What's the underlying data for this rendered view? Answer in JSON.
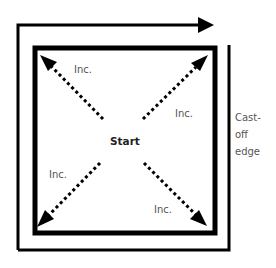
{
  "diagram": {
    "center_label": "Start",
    "increase_labels": [
      "Inc.",
      "Inc.",
      "Inc.",
      "Inc."
    ],
    "edge_label": [
      "Cast-",
      "off",
      "edge"
    ],
    "colors": {
      "stroke": "#000000",
      "label": "#555555",
      "background": "#ffffff"
    }
  }
}
